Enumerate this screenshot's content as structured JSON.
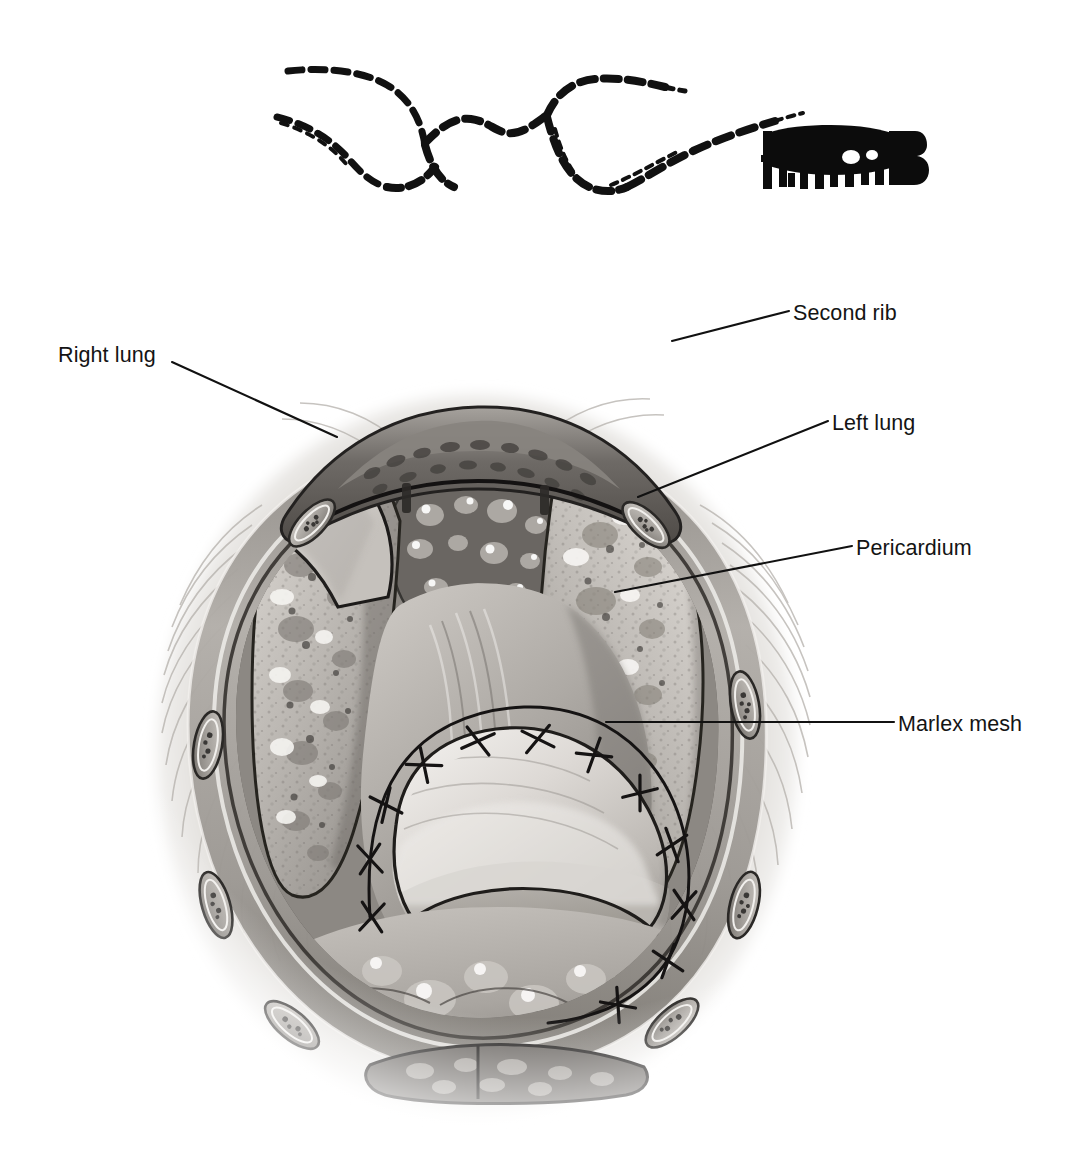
{
  "figure": {
    "background_color": "#ffffff",
    "ink_color": "#141414",
    "style": "grayscale medical line-and-tone illustration",
    "view": "anterior transverse view into opened thorax, clamshell / median sternotomy exposure"
  },
  "signature": {
    "name": "artist-signature",
    "text": "H.Thomas",
    "description": "hand-drawn dashed double contour line sweeping left to right ending in a blocky inked monogram"
  },
  "labels": [
    {
      "id": "second-rib",
      "text": "Second rib",
      "side": "right",
      "leader_from": [
        789,
        311
      ],
      "leader_to": [
        672,
        341
      ]
    },
    {
      "id": "left-lung",
      "text": "Left lung",
      "side": "right",
      "leader_from": [
        828,
        421
      ],
      "leader_to": [
        638,
        497
      ]
    },
    {
      "id": "pericardium",
      "text": "Pericardium",
      "side": "right",
      "leader_from": [
        852,
        546
      ],
      "leader_to": [
        615,
        592
      ]
    },
    {
      "id": "marlex-mesh",
      "text": "Marlex mesh",
      "side": "right",
      "leader_from": [
        894,
        722
      ],
      "leader_to": [
        606,
        722
      ]
    },
    {
      "id": "right-lung",
      "text": "Right lung",
      "side": "left",
      "leader_from": [
        172,
        362
      ],
      "leader_to": [
        337,
        437
      ]
    }
  ],
  "anatomy": {
    "structures": [
      "chest wall soft tissue",
      "second rib",
      "rib cross-sections with marrow",
      "sternum cross-section",
      "right lung",
      "left lung",
      "mediastinal fat",
      "pericardium",
      "Marlex mesh patch",
      "suture line",
      "diaphragm",
      "surgical retractor blade"
    ],
    "suture_count": 12,
    "rib_cross_sections": 8
  },
  "palette": {
    "paper": "#ffffff",
    "line": "#141414",
    "tissue_light": "#d9d6d2",
    "tissue_mid": "#a9a5a1",
    "tissue_dark": "#6d6964",
    "tissue_deep": "#444140",
    "lung_tone": "#bcb8b3",
    "mesh_tone": "#e2dfdb",
    "muscle_tone": "#cfcbc6"
  }
}
